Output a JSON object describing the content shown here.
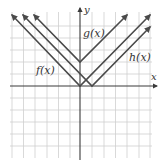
{
  "diagram": {
    "type": "coordinate-graph",
    "axes": {
      "x_label": "x",
      "y_label": "y",
      "origin_px": [
        80,
        86
      ],
      "unit_px": 11.8,
      "x_range": [
        -6,
        6
      ],
      "y_range": [
        -6,
        5
      ]
    },
    "functions": [
      {
        "name": "f",
        "label": "f(x)",
        "formula": "|x|",
        "vertex": [
          0,
          0
        ],
        "color": "#4a4a4a"
      },
      {
        "name": "g",
        "label": "g(x)",
        "formula": "|x| + 2",
        "vertex": [
          0,
          2
        ],
        "color": "#4a4a4a"
      },
      {
        "name": "h",
        "label": "h(x)",
        "formula": "|x - 1|",
        "vertex": [
          1,
          0
        ],
        "color": "#4a4a4a"
      }
    ],
    "colors": {
      "grid": "#cfcfcf",
      "axis": "#3a3a3a",
      "curve": "#4a4a4a",
      "background": "#ffffff"
    }
  }
}
